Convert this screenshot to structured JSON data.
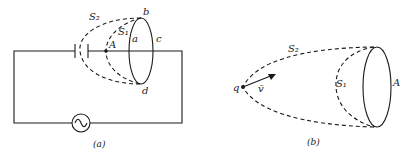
{
  "figure_a": {
    "caption": "(a)",
    "labels": {
      "s2": "S₂",
      "s1": "S₁",
      "point_a": "A",
      "b": "b",
      "a": "a",
      "c": "c",
      "d": "d"
    },
    "components": [
      "capacitor",
      "ac-source",
      "closed-loop-abcd",
      "surface-S1",
      "surface-S2"
    ]
  },
  "figure_b": {
    "caption": "(b)",
    "labels": {
      "s2": "S₂",
      "s1": "S₁",
      "loop": "A",
      "charge": "q",
      "velocity": "v̄"
    },
    "components": [
      "moving-charge",
      "velocity-arrow",
      "loop-A",
      "surface-S1",
      "surface-S2"
    ]
  }
}
